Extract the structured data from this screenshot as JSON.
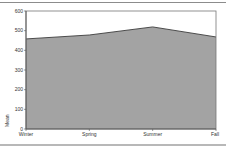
{
  "chart_data": {
    "type": "area",
    "title": "",
    "xlabel": "",
    "ylabel": "Mean",
    "categories": [
      "Winter",
      "Spring",
      "Summer",
      "Fall"
    ],
    "series": [
      {
        "name": "Mean",
        "values": [
          458,
          478,
          519,
          468
        ]
      }
    ],
    "ylim": [
      0,
      600
    ],
    "yticks": [
      0,
      100,
      200,
      300,
      400,
      500,
      600
    ],
    "grid": false,
    "legend": "none",
    "colors": {
      "fill": "#a3a3a3",
      "line": "#3c3c3c",
      "axis": "#555555"
    }
  }
}
